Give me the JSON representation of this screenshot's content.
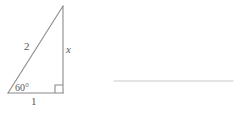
{
  "figure": {
    "type": "right-triangle-30-60-90",
    "stroke_color": "#8a8a8c",
    "text_color": "#59595b",
    "background_color": "#ffffff",
    "vertices": {
      "apex": [
        63,
        6
      ],
      "bottom_left": [
        8,
        93
      ],
      "bottom_right": [
        63,
        93
      ]
    },
    "labels": {
      "hypotenuse": "2",
      "vertical_leg": "x",
      "base": "1",
      "angle": "60°"
    },
    "right_angle_marker": {
      "present": true,
      "size": 8,
      "vertex": "bottom_right"
    }
  },
  "answer_rule": {
    "visible": true,
    "color": "#c9c9cb",
    "x_start": 114,
    "x_end": 233,
    "y": 81
  }
}
